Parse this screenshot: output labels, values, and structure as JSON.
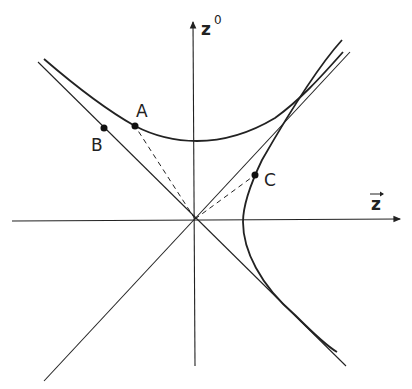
{
  "diagram": {
    "type": "spacetime hyperbola diagram",
    "axes": {
      "vertical": {
        "label": "z",
        "superscript": "0"
      },
      "horizontal": {
        "label": "z",
        "vector_arrow": "→"
      }
    },
    "points": [
      {
        "id": "A",
        "label": "A",
        "on": "upper hyperbola (timelike)"
      },
      {
        "id": "B",
        "label": "B",
        "on": "light cone"
      },
      {
        "id": "C",
        "label": "C",
        "on": "right hyperbola (spacelike)"
      }
    ],
    "curves": [
      "light cone (two diagonals)",
      "upper hyperbola",
      "right hyperbola"
    ],
    "dashed_lines": [
      "origin to A",
      "origin to C"
    ],
    "colors": {
      "ink": "#222222",
      "background": "#ffffff"
    }
  }
}
